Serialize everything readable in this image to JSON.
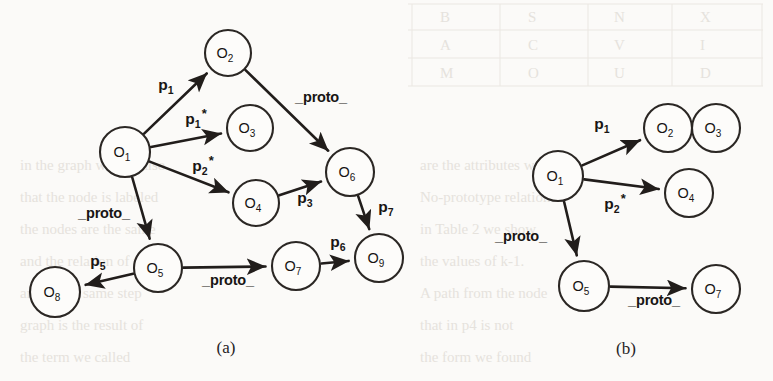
{
  "figure": {
    "caption_a": "(a)",
    "caption_b": "(b)",
    "background_color": "#fbfaf8",
    "ink_color": "#211d1b"
  },
  "diagram_a": {
    "name": "object-graph-full",
    "nodes": [
      {
        "id": "O1",
        "label": "O",
        "sub": "1",
        "cx": 125,
        "cy": 152,
        "r": 25
      },
      {
        "id": "O2",
        "label": "O",
        "sub": "2",
        "cx": 228,
        "cy": 53,
        "r": 23
      },
      {
        "id": "O3",
        "label": "O",
        "sub": "3",
        "cx": 250,
        "cy": 128,
        "r": 23
      },
      {
        "id": "O4",
        "label": "O",
        "sub": "4",
        "cx": 256,
        "cy": 203,
        "r": 23
      },
      {
        "id": "O5",
        "label": "O",
        "sub": "5",
        "cx": 158,
        "cy": 268,
        "r": 24
      },
      {
        "id": "O6",
        "label": "O",
        "sub": "6",
        "cx": 350,
        "cy": 172,
        "r": 24
      },
      {
        "id": "O7",
        "label": "O",
        "sub": "7",
        "cx": 296,
        "cy": 266,
        "r": 24
      },
      {
        "id": "O8",
        "label": "O",
        "sub": "8",
        "cx": 55,
        "cy": 292,
        "r": 25
      },
      {
        "id": "O9",
        "label": "O",
        "sub": "9",
        "cx": 379,
        "cy": 258,
        "r": 24
      }
    ],
    "edges": [
      {
        "from": "O1",
        "to": "O2",
        "label": "p",
        "sub": "1",
        "star": false,
        "lx": 166,
        "ly": 86
      },
      {
        "from": "O1",
        "to": "O3",
        "label": "p",
        "sub": "1",
        "star": true,
        "lx": 196,
        "ly": 120
      },
      {
        "from": "O1",
        "to": "O4",
        "label": "p",
        "sub": "2",
        "star": true,
        "lx": 203,
        "ly": 167
      },
      {
        "from": "O1",
        "to": "O5",
        "label": "_proto_",
        "sub": "",
        "star": false,
        "lx": 104,
        "ly": 214
      },
      {
        "from": "O2",
        "to": "O6",
        "label": "_proto_",
        "sub": "",
        "star": false,
        "lx": 321,
        "ly": 98
      },
      {
        "from": "O4",
        "to": "O6",
        "label": "p",
        "sub": "3",
        "star": false,
        "lx": 305,
        "ly": 199
      },
      {
        "from": "O6",
        "to": "O9",
        "label": "p",
        "sub": "7",
        "star": false,
        "lx": 386,
        "ly": 208
      },
      {
        "from": "O5",
        "to": "O8",
        "label": "p",
        "sub": "5",
        "star": false,
        "lx": 98,
        "ly": 262
      },
      {
        "from": "O5",
        "to": "O7",
        "label": "_proto_",
        "sub": "",
        "star": false,
        "lx": 228,
        "ly": 281
      },
      {
        "from": "O7",
        "to": "O9",
        "label": "p",
        "sub": "6",
        "star": false,
        "lx": 338,
        "ly": 243
      }
    ]
  },
  "diagram_b": {
    "name": "object-graph-reduced",
    "nodes": [
      {
        "id": "O1",
        "label": "O",
        "sub": "1",
        "cx": 558,
        "cy": 176,
        "r": 25
      },
      {
        "id": "O2",
        "label": "O",
        "sub": "2",
        "cx": 668,
        "cy": 128,
        "r": 24
      },
      {
        "id": "O3",
        "label": "O",
        "sub": "3",
        "cx": 716,
        "cy": 128,
        "r": 24
      },
      {
        "id": "O4",
        "label": "O",
        "sub": "4",
        "cx": 689,
        "cy": 193,
        "r": 24
      },
      {
        "id": "O5",
        "label": "O",
        "sub": "5",
        "cx": 584,
        "cy": 286,
        "r": 25
      },
      {
        "id": "O7",
        "label": "O",
        "sub": "7",
        "cx": 716,
        "cy": 289,
        "r": 24
      }
    ],
    "edges": [
      {
        "from": "O1",
        "to": "O2",
        "label": "p",
        "sub": "1",
        "star": false,
        "lx": 602,
        "ly": 125
      },
      {
        "from": "O1",
        "to": "O4",
        "label": "p",
        "sub": "2",
        "star": true,
        "lx": 615,
        "ly": 205
      },
      {
        "from": "O1",
        "to": "O5",
        "label": "_proto_",
        "sub": "",
        "star": false,
        "lx": 521,
        "ly": 237
      },
      {
        "from": "O5",
        "to": "O7",
        "label": "_proto_",
        "sub": "",
        "star": false,
        "lx": 654,
        "ly": 301
      }
    ]
  },
  "background_bleed": {
    "description": "faint show-through of reverse-page text and a table",
    "lines": [
      {
        "text": "",
        "x": 0,
        "y": 0
      }
    ]
  }
}
